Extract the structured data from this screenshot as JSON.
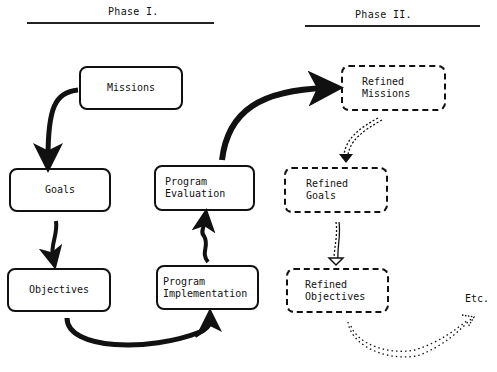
{
  "phases": [
    {
      "title": "Phase I."
    },
    {
      "title": "Phase II."
    }
  ],
  "phase1": {
    "boxes": {
      "missions": "Missions",
      "goals": "Goals",
      "objectives": "Objectives",
      "program_implementation": "Program\nImplementation",
      "program_evaluation": "Program\nEvaluation"
    }
  },
  "phase2": {
    "boxes": {
      "refined_missions": "Refined\nMissions",
      "refined_goals": "Refined\nGoals",
      "refined_objectives": "Refined\nObjectives"
    },
    "continuation": "Etc."
  },
  "colors": {
    "ink": "#111111",
    "background": "#ffffff"
  }
}
